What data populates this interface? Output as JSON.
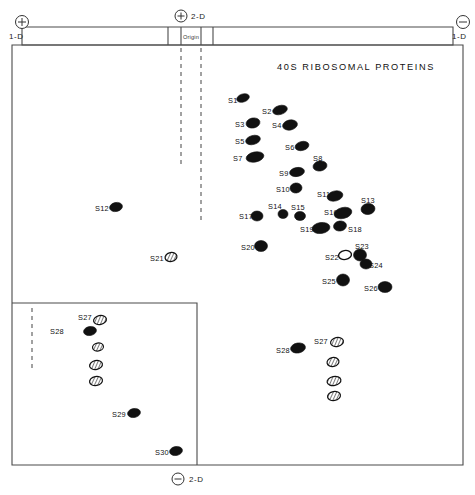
{
  "figure": {
    "title": "40S RIBOSOMAL PROTEINS",
    "origin_label": "Origin",
    "axes": {
      "top_left": {
        "sign": "+",
        "label": "1-D"
      },
      "top_right": {
        "sign": "-",
        "label": "1-D"
      },
      "top_center": {
        "sign": "+",
        "label": "2-D"
      },
      "bottom_center": {
        "sign": "-",
        "label": "2-D"
      }
    }
  },
  "chart_data": {
    "type": "scatter",
    "title": "40S RIBOSOMAL PROTEINS",
    "xlabel": "1-D",
    "ylabel": "2-D",
    "grid": false,
    "legend": "none",
    "xlim": [
      0,
      475
    ],
    "ylim": [
      0,
      495
    ],
    "spots": [
      {
        "label": "S1",
        "cx": 243,
        "cy": 98,
        "rx": 6.5,
        "ry": 4.0,
        "rot": -18,
        "style": "filled",
        "lx": 228,
        "ly": 100
      },
      {
        "label": "S2",
        "cx": 280,
        "cy": 110,
        "rx": 7.5,
        "ry": 4.5,
        "rot": -16,
        "style": "filled",
        "lx": 262,
        "ly": 111
      },
      {
        "label": "S3",
        "cx": 253,
        "cy": 123,
        "rx": 7.0,
        "ry": 5.0,
        "rot": -12,
        "style": "filled",
        "lx": 235,
        "ly": 124
      },
      {
        "label": "S4",
        "cx": 290,
        "cy": 125,
        "rx": 7.5,
        "ry": 5.0,
        "rot": -12,
        "style": "filled",
        "lx": 272,
        "ly": 125
      },
      {
        "label": "S5",
        "cx": 253,
        "cy": 140,
        "rx": 7.5,
        "ry": 4.5,
        "rot": -15,
        "style": "filled",
        "lx": 235,
        "ly": 141
      },
      {
        "label": "S6",
        "cx": 302,
        "cy": 146,
        "rx": 7.0,
        "ry": 4.5,
        "rot": -14,
        "style": "filled",
        "lx": 285,
        "ly": 147
      },
      {
        "label": "S7",
        "cx": 255,
        "cy": 157,
        "rx": 9.0,
        "ry": 5.0,
        "rot": -12,
        "style": "filled",
        "lx": 233,
        "ly": 158
      },
      {
        "label": "S8",
        "cx": 320,
        "cy": 166,
        "rx": 7.0,
        "ry": 5.0,
        "rot": -10,
        "style": "filled",
        "lx": 313,
        "ly": 158
      },
      {
        "label": "S9",
        "cx": 297,
        "cy": 172,
        "rx": 7.5,
        "ry": 4.5,
        "rot": -10,
        "style": "filled",
        "lx": 279,
        "ly": 173
      },
      {
        "label": "S10",
        "cx": 296,
        "cy": 188,
        "rx": 6.0,
        "ry": 5.0,
        "rot": -8,
        "style": "filled",
        "lx": 276,
        "ly": 189
      },
      {
        "label": "S11",
        "cx": 335,
        "cy": 196,
        "rx": 8.0,
        "ry": 5.0,
        "rot": -14,
        "style": "filled",
        "lx": 317,
        "ly": 194
      },
      {
        "label": "S12",
        "cx": 116,
        "cy": 207,
        "rx": 6.5,
        "ry": 4.5,
        "rot": -12,
        "style": "filled",
        "lx": 95,
        "ly": 208
      },
      {
        "label": "S13",
        "cx": 368,
        "cy": 209,
        "rx": 7.0,
        "ry": 5.5,
        "rot": -8,
        "style": "filled",
        "lx": 361,
        "ly": 200
      },
      {
        "label": "S14",
        "cx": 283,
        "cy": 214,
        "rx": 5.0,
        "ry": 4.5,
        "rot": 0,
        "style": "filled",
        "lx": 268,
        "ly": 206
      },
      {
        "label": "S15",
        "cx": 300,
        "cy": 216,
        "rx": 5.5,
        "ry": 4.5,
        "rot": 0,
        "style": "filled",
        "lx": 291,
        "ly": 207
      },
      {
        "label": "S16",
        "cx": 343,
        "cy": 213,
        "rx": 9.0,
        "ry": 5.5,
        "rot": -14,
        "style": "filled",
        "lx": 324,
        "ly": 212
      },
      {
        "label": "S17",
        "cx": 257,
        "cy": 216,
        "rx": 6.0,
        "ry": 5.0,
        "rot": 0,
        "style": "filled",
        "lx": 239,
        "ly": 216
      },
      {
        "label": "S18",
        "cx": 340,
        "cy": 226,
        "rx": 6.5,
        "ry": 5.0,
        "rot": -10,
        "style": "filled",
        "lx": 348,
        "ly": 229
      },
      {
        "label": "S19",
        "cx": 321,
        "cy": 228,
        "rx": 9.0,
        "ry": 5.5,
        "rot": -8,
        "style": "filled",
        "lx": 300,
        "ly": 229
      },
      {
        "label": "S20",
        "cx": 261,
        "cy": 246,
        "rx": 6.5,
        "ry": 5.5,
        "rot": 0,
        "style": "filled",
        "lx": 241,
        "ly": 247
      },
      {
        "label": "S21",
        "cx": 171,
        "cy": 257,
        "rx": 6.0,
        "ry": 4.5,
        "rot": -10,
        "style": "hatched",
        "lx": 150,
        "ly": 258
      },
      {
        "label": "S22",
        "cx": 345,
        "cy": 255,
        "rx": 6.5,
        "ry": 4.5,
        "rot": -10,
        "style": "open",
        "lx": 325,
        "ly": 257
      },
      {
        "label": "S23",
        "cx": 360,
        "cy": 255,
        "rx": 6.5,
        "ry": 6.0,
        "rot": 0,
        "style": "filled",
        "lx": 355,
        "ly": 246
      },
      {
        "label": "S24",
        "cx": 366,
        "cy": 264,
        "rx": 6.0,
        "ry": 5.0,
        "rot": 0,
        "style": "filled",
        "lx": 369,
        "ly": 265
      },
      {
        "label": "S25",
        "cx": 343,
        "cy": 280,
        "rx": 6.5,
        "ry": 6.0,
        "rot": 0,
        "style": "filled",
        "lx": 322,
        "ly": 281
      },
      {
        "label": "S26",
        "cx": 385,
        "cy": 287,
        "rx": 7.0,
        "ry": 5.5,
        "rot": 0,
        "style": "filled",
        "lx": 364,
        "ly": 288
      },
      {
        "label": "S27",
        "cx": 100,
        "cy": 320,
        "rx": 6.5,
        "ry": 4.5,
        "rot": -12,
        "style": "hatched",
        "lx": 78,
        "ly": 317
      },
      {
        "label": "S28",
        "cx": 90,
        "cy": 331,
        "rx": 6.5,
        "ry": 4.5,
        "rot": -10,
        "style": "filled",
        "lx": 50,
        "ly": 331
      },
      {
        "label": "",
        "cx": 98,
        "cy": 347,
        "rx": 5.5,
        "ry": 4.0,
        "rot": -10,
        "style": "hatched",
        "lx": 0,
        "ly": 0
      },
      {
        "label": "",
        "cx": 96,
        "cy": 365,
        "rx": 6.5,
        "ry": 4.5,
        "rot": -12,
        "style": "hatched",
        "lx": 0,
        "ly": 0
      },
      {
        "label": "",
        "cx": 96,
        "cy": 381,
        "rx": 6.5,
        "ry": 4.5,
        "rot": -10,
        "style": "hatched",
        "lx": 0,
        "ly": 0
      },
      {
        "label": "S29",
        "cx": 134,
        "cy": 413,
        "rx": 6.5,
        "ry": 4.5,
        "rot": -10,
        "style": "filled",
        "lx": 112,
        "ly": 414
      },
      {
        "label": "S30",
        "cx": 176,
        "cy": 451,
        "rx": 6.5,
        "ry": 4.5,
        "rot": -10,
        "style": "filled",
        "lx": 155,
        "ly": 452
      },
      {
        "label": "S27",
        "cx": 337,
        "cy": 342,
        "rx": 6.5,
        "ry": 4.5,
        "rot": -12,
        "style": "hatched",
        "lx": 314,
        "ly": 341
      },
      {
        "label": "S28",
        "cx": 298,
        "cy": 348,
        "rx": 7.5,
        "ry": 5.0,
        "rot": -10,
        "style": "filled",
        "lx": 276,
        "ly": 350
      },
      {
        "label": "",
        "cx": 333,
        "cy": 362,
        "rx": 6.0,
        "ry": 4.5,
        "rot": -10,
        "style": "hatched",
        "lx": 0,
        "ly": 0
      },
      {
        "label": "",
        "cx": 334,
        "cy": 381,
        "rx": 7.0,
        "ry": 4.5,
        "rot": -12,
        "style": "hatched",
        "lx": 0,
        "ly": 0
      },
      {
        "label": "",
        "cx": 334,
        "cy": 396,
        "rx": 6.5,
        "ry": 4.5,
        "rot": -10,
        "style": "hatched",
        "lx": 0,
        "ly": 0
      }
    ]
  }
}
